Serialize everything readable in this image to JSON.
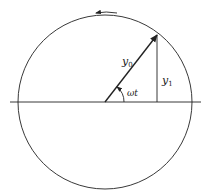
{
  "diagram": {
    "type": "phasor",
    "labels": {
      "amplitude": "y",
      "amplitude_sub": "0",
      "projection": "y",
      "projection_sub": "1",
      "angle": "ωt"
    },
    "rotation_direction": "counterclockwise",
    "colors": {
      "stroke": "#222222",
      "background": "#ffffff"
    }
  }
}
